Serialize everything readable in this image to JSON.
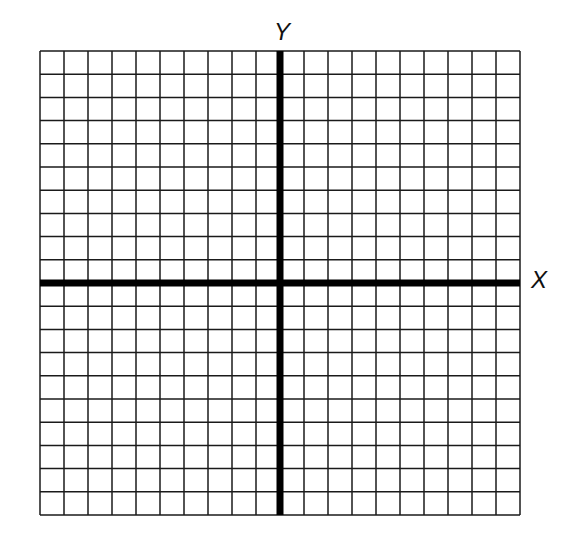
{
  "title": "",
  "axes": {
    "x_label": "X",
    "y_label": "Y"
  },
  "grid": {
    "columns": 20,
    "rows": 20,
    "left": 40,
    "top": 51,
    "width": 480,
    "height": 464,
    "line_color": "#1a1a1a",
    "axis_color": "#000000",
    "origin_col": 10,
    "origin_row": 10
  }
}
